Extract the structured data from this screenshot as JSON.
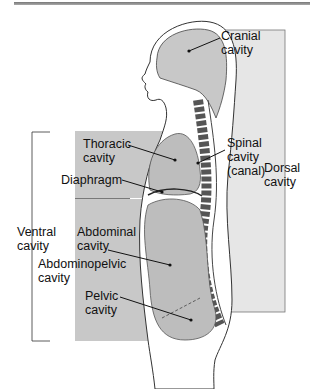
{
  "figure": {
    "colors": {
      "dorsal_box": "#e6e6e6",
      "ventral_box": "#c8c8c8",
      "organ_fill": "#bdbdbd",
      "body_fill": "#ffffff",
      "line": "#222222"
    },
    "labels": {
      "cranial": "Cranial\ncavity",
      "spinal": "Spinal\ncavity\n(canal)",
      "dorsal": "Dorsal\ncavity",
      "thoracic": "Thoracic\ncavity",
      "diaphragm": "Diaphragm",
      "ventral": "Ventral\ncavity",
      "abdominal": "Abdominal\ncavity",
      "abdominopelvic": "Abdominopelvic\ncavity",
      "pelvic": "Pelvic\ncavity"
    }
  }
}
